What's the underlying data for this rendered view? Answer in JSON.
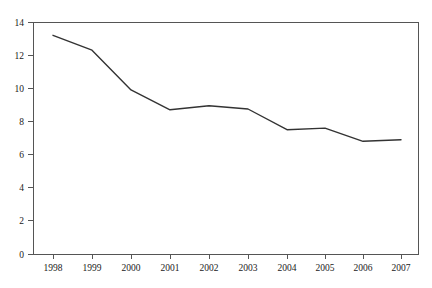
{
  "chart_data": {
    "type": "line",
    "title": "",
    "subtitle": "",
    "xlabel": "",
    "ylabel": "",
    "categories": [
      "1998",
      "1999",
      "2000",
      "2001",
      "2002",
      "2003",
      "2004",
      "2005",
      "2006",
      "2007"
    ],
    "x": [
      1998,
      1999,
      2000,
      2001,
      2002,
      2003,
      2004,
      2005,
      2006,
      2007
    ],
    "values": [
      13.2,
      12.3,
      9.9,
      8.7,
      8.95,
      8.75,
      7.5,
      7.6,
      6.8,
      6.9
    ],
    "series": [
      {
        "name": "",
        "values": [
          13.2,
          12.3,
          9.9,
          8.7,
          8.95,
          8.75,
          7.5,
          7.6,
          6.8,
          6.9
        ]
      }
    ],
    "ylim": [
      0,
      14
    ],
    "yticks": [
      0,
      2,
      4,
      6,
      8,
      10,
      12,
      14
    ],
    "ytick_labels": [
      "0",
      "2",
      "4",
      "6",
      "8",
      "10",
      "12",
      "14"
    ],
    "xtick_labels": [
      "1998",
      "1999",
      "2000",
      "2001",
      "2002",
      "2003",
      "2004",
      "2005",
      "2006",
      "2007"
    ],
    "grid": false,
    "legend": false,
    "legend_position": "none",
    "annotations": [],
    "line_color": "#333333",
    "axis_color": "#555555",
    "background_color": "#ffffff"
  },
  "plot": {
    "frame_left": 33,
    "frame_right": 418,
    "frame_top": 22,
    "frame_bottom": 254
  }
}
